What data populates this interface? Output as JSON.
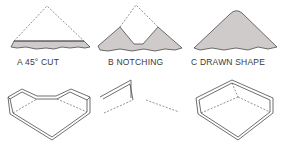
{
  "diagram": {
    "colors": {
      "line": "#4a4a4a",
      "fill": "#cfcbca",
      "background": "#ffffff"
    },
    "panels": [
      {
        "id": "A",
        "label": "A  45° CUT"
      },
      {
        "id": "B",
        "label": "B  NOTCHING"
      },
      {
        "id": "C",
        "label": "C  DRAWN SHAPE"
      }
    ]
  }
}
